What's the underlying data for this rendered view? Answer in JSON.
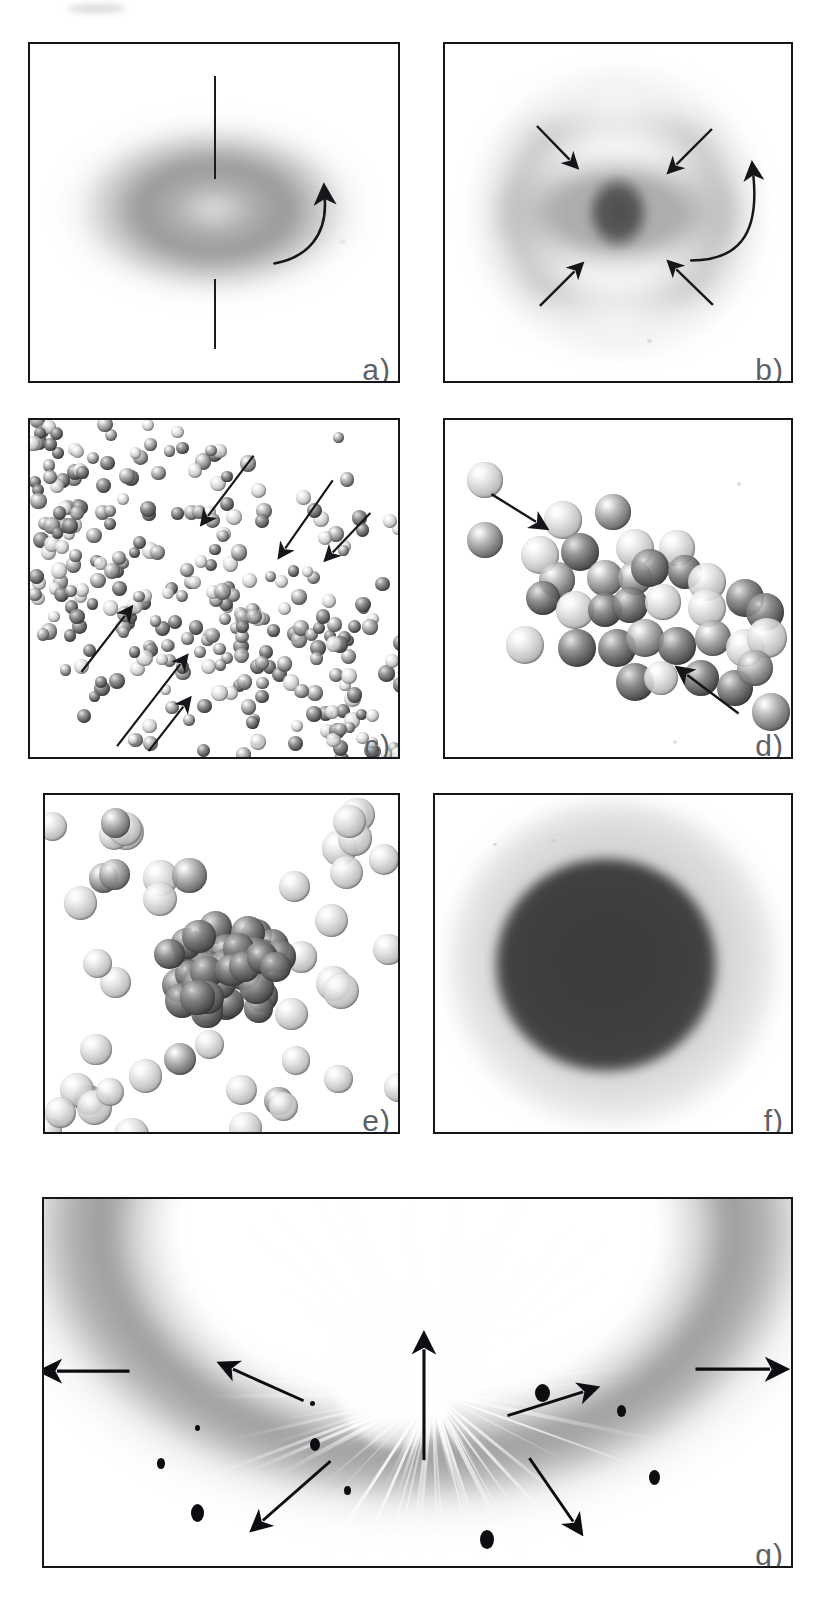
{
  "figure": {
    "type": "multi-panel-scientific-illustration",
    "panel_count": 7,
    "background_color": "#ffffff",
    "frame_color": "#15161a",
    "label_color": "#5d6066"
  },
  "panels": [
    {
      "id": "a",
      "label": "a)",
      "caption_letter": "a",
      "content": "rotating deformed (oblate) nucleus with vertical rotation axis and curved rotation arrow",
      "elements": {
        "rotation_axis": "vertical line through centre",
        "rotation_arrow": "curved arrow on right side pointing counter-clockwise upward",
        "cloud": "diffuse grey ellipsoidal density distribution"
      }
    },
    {
      "id": "b",
      "label": "b)",
      "caption_letter": "b",
      "content": "compound nucleus with dense dark core, surrounding halo and four inward converging arrows plus curved rotation arrow",
      "elements": {
        "core": "dark compact central core",
        "inward_arrows": 4,
        "rotation_arrow": "curved arrow at right edge"
      }
    },
    {
      "id": "c",
      "label": "c)",
      "caption_letter": "c",
      "content": "dense gas of individual nucleons (shaded spheres) with five arrows indicating converging nucleon flow",
      "elements": {
        "nucleon_count_approx": 300,
        "arrow_count": 5
      }
    },
    {
      "id": "d",
      "label": "d)",
      "caption_letter": "d",
      "content": "diagonal elongated cluster / neck configuration of nucleons with two converging arrows",
      "elements": {
        "nucleon_count_approx": 33,
        "arrow_count": 2
      }
    },
    {
      "id": "e",
      "label": "e)",
      "caption_letter": "e",
      "content": "compact dark cluster of bound nucleons surrounded by scattered lighter free nucleons",
      "elements": {
        "cluster_nucleons_approx": 40,
        "free_nucleons_approx": 45
      }
    },
    {
      "id": "f",
      "label": "f)",
      "caption_letter": "f",
      "content": "thermally equilibrated hot compound nucleus shown as a uniform dark sphere with diffuse surface",
      "elements": {
        "core": "uniform dark spherical density",
        "halo": "diffuse grey surface gradient"
      }
    },
    {
      "id": "g",
      "label": "g)",
      "caption_letter": "g",
      "content": "explosive multifragmentation: bright radial burst with emitted fragments and outward arrows beneath a dark curved shell",
      "elements": {
        "burst": "radial white streaks from central source",
        "dark_arc": "curved dark shell across the top",
        "fragments": 9,
        "outward_arrows": 6
      }
    }
  ],
  "layout": {
    "rows": [
      {
        "row": 1,
        "panels": [
          "a",
          "b"
        ]
      },
      {
        "row": 2,
        "panels": [
          "c",
          "d"
        ]
      },
      {
        "row": 3,
        "panels": [
          "e",
          "f"
        ]
      },
      {
        "row": 4,
        "panels": [
          "g"
        ]
      }
    ]
  }
}
